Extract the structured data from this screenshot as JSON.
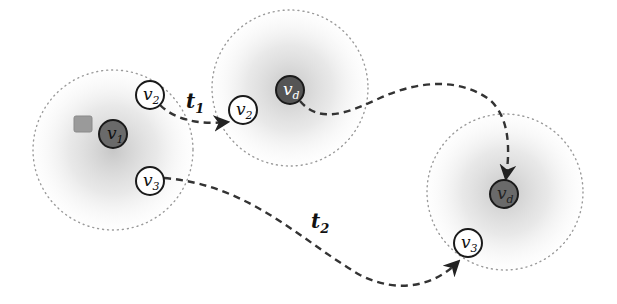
{
  "colors": {
    "background": "#ffffff",
    "region_dots": "#9a9a9a",
    "region_glow": "#c8c8c8",
    "dark_node_fill": "#6a6a6a",
    "node_stroke": "#1a1a1a",
    "white_node_fill": "#ffffff",
    "square_fill": "#9a9a9a",
    "path_stroke": "#333333"
  },
  "regions": [
    {
      "id": "region-1",
      "cx": 113,
      "cy": 150,
      "r": 80
    },
    {
      "id": "region-2",
      "cx": 290,
      "cy": 88,
      "r": 78
    },
    {
      "id": "region-3",
      "cx": 505,
      "cy": 192,
      "r": 78
    }
  ],
  "nodes": [
    {
      "id": "v1",
      "base": "v",
      "sub": "1",
      "cx": 113,
      "cy": 134,
      "r": 14,
      "type": "dark"
    },
    {
      "id": "v2-a",
      "base": "v",
      "sub": "2",
      "cx": 150,
      "cy": 95,
      "r": 14,
      "type": "white"
    },
    {
      "id": "v3-a",
      "base": "v",
      "sub": "3",
      "cx": 150,
      "cy": 181,
      "r": 14,
      "type": "white"
    },
    {
      "id": "v2-b",
      "base": "v",
      "sub": "2",
      "cx": 243,
      "cy": 110,
      "r": 14,
      "type": "white"
    },
    {
      "id": "vd-a",
      "base": "v",
      "sub": "d",
      "cx": 290,
      "cy": 90,
      "r": 14,
      "type": "dark"
    },
    {
      "id": "vd-b",
      "base": "v",
      "sub": "d",
      "cx": 504,
      "cy": 194,
      "r": 14,
      "type": "dark"
    },
    {
      "id": "v3-b",
      "base": "v",
      "sub": "3",
      "cx": 468,
      "cy": 243,
      "r": 14,
      "type": "white"
    }
  ],
  "square": {
    "x": 74,
    "y": 116,
    "w": 18,
    "h": 16
  },
  "edges": [
    {
      "id": "t1",
      "base": "t",
      "sub": "1",
      "label_x": 186,
      "label_y": 111
    },
    {
      "id": "t2",
      "base": "t",
      "sub": "2",
      "label_x": 311,
      "label_y": 232
    },
    {
      "id": "vd-move"
    }
  ]
}
